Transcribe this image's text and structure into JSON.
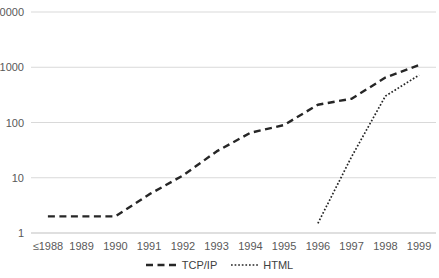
{
  "chart_data": {
    "type": "line",
    "title": "",
    "xlabel": "",
    "ylabel": "",
    "grid": "horizontal",
    "legend_position": "bottom",
    "x_axis": {
      "categories": [
        "≤1988",
        "1989",
        "1990",
        "1991",
        "1992",
        "1993",
        "1994",
        "1995",
        "1996",
        "1997",
        "1998",
        "1999"
      ]
    },
    "y_axis": {
      "scale": "log",
      "min": 1,
      "max": 10000,
      "ticks": [
        1,
        10,
        100,
        1000,
        10000
      ],
      "tick_labels": [
        "1",
        "10",
        "100",
        "1000",
        "10000"
      ]
    },
    "series": [
      {
        "name": "TCP/IP",
        "line_style": "dashed",
        "color": "#262626",
        "values": [
          2,
          2,
          2,
          5,
          11,
          30,
          65,
          90,
          210,
          270,
          650,
          1100
        ]
      },
      {
        "name": "HTML",
        "line_style": "dotted",
        "color": "#262626",
        "values": [
          null,
          null,
          null,
          null,
          null,
          null,
          null,
          null,
          1.5,
          24,
          300,
          720
        ]
      }
    ],
    "colors": {
      "gridline": "#d9d9d9",
      "axis_line": "#bfbfbf",
      "tick_text": "#595959",
      "series_line": "#262626",
      "background": "#ffffff"
    }
  }
}
